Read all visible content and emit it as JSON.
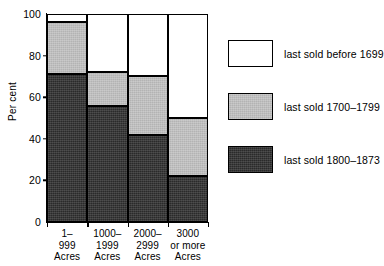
{
  "chart_data": {
    "type": "bar",
    "title": "",
    "subtitle": "",
    "xlabel": "",
    "ylabel": "Per cent",
    "stacked": true,
    "stack_total": 100,
    "ylim": [
      0,
      100
    ],
    "yticks": [
      0,
      20,
      40,
      60,
      80,
      100
    ],
    "ytick_labels": [
      "0",
      "20",
      "40",
      "60",
      "80",
      "100"
    ],
    "grid": false,
    "legend_position": "right",
    "categories": [
      "1–\n999\nAcres",
      "1000–\n1999\nAcres",
      "2000–\n2999\nAcres",
      "3000\nor more\nAcres"
    ],
    "category_lines": [
      [
        "1–",
        "999",
        "Acres"
      ],
      [
        "1000–",
        "1999",
        "Acres"
      ],
      [
        "2000–",
        "2999",
        "Acres"
      ],
      [
        "3000",
        "or more",
        "Acres"
      ]
    ],
    "series": [
      {
        "name": "last sold 1800–1873",
        "color": "#2a2a2a",
        "values": [
          71,
          56,
          42,
          22
        ]
      },
      {
        "name": "last sold 1700–1799",
        "color": "#b3b3b3",
        "values": [
          25,
          16,
          28,
          28
        ]
      },
      {
        "name": "last sold before 1699",
        "color": "#ffffff",
        "values": [
          4,
          28,
          30,
          50
        ]
      }
    ],
    "cumulative_tops": {
      "last sold 1800–1873": [
        71,
        56,
        42,
        22
      ],
      "last sold 1700–1799": [
        96,
        72,
        70,
        50
      ],
      "last sold before 1699": [
        100,
        100,
        100,
        100
      ]
    }
  },
  "legend": {
    "items": [
      {
        "label": "last sold before 1699",
        "swatch": "white",
        "color": "#ffffff"
      },
      {
        "label": "last sold 1700–1799",
        "swatch": "gray",
        "color": "#b3b3b3"
      },
      {
        "label": "last sold 1800–1873",
        "swatch": "dark",
        "color": "#2a2a2a"
      }
    ]
  },
  "axis": {
    "y_title": "Per cent",
    "y_ticks": [
      "100",
      "80",
      "60",
      "40",
      "20",
      "0"
    ]
  }
}
